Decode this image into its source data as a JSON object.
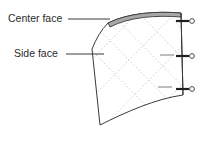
{
  "figure": {
    "background_color": "#ffffff",
    "line_color": "#3a3a3a",
    "dotted_grid_color": "#c2c2c2",
    "shaded_fill_color": "#a8a8a8",
    "labels": [
      {
        "id": "center-face",
        "text": "Center face",
        "x": 8,
        "y": 19,
        "leader_from_x": 68,
        "leader_from_y": 19,
        "leader_to_x": 110,
        "leader_to_y": 19
      },
      {
        "id": "side-face",
        "text": "Side face",
        "x": 14,
        "y": 54,
        "leader_from_x": 66,
        "leader_from_y": 54,
        "leader_to_x": 104,
        "leader_to_y": 54
      }
    ],
    "edge_markers": [
      {
        "id": "marker-top",
        "stub_x1": 176,
        "stub_x2": 189,
        "y": 21,
        "circle_cx": 192,
        "circle_cy": 21,
        "circle_r": 2.4
      },
      {
        "id": "marker-middle",
        "stub_x1": 176,
        "stub_x2": 189,
        "y": 56,
        "circle_cx": 192,
        "circle_cy": 56,
        "circle_r": 2.4
      },
      {
        "id": "marker-bottom",
        "stub_x1": 176,
        "stub_x2": 189,
        "y": 89,
        "circle_cx": 192,
        "circle_cy": 89,
        "circle_r": 2.4
      }
    ],
    "shell": {
      "name": "curved-shell-surface",
      "outline_path": "M 108,23 C 128,13 156,11 181,13 L 183,95 C 155,99 126,112 100,125 L 92,49 C 96,39 101,30 108,23 Z"
    },
    "center_face_band": {
      "name": "center-face-shaded-band",
      "path": "M 108,23 C 128,13 156,11 181,13 L 181,17 C 156,15 129,17 110,27 Z"
    },
    "right_edge": {
      "name": "right-vertical-edge",
      "x_top": 181,
      "y_top": 13,
      "x_bottom": 183,
      "y_bottom": 95
    },
    "tick_arrows": [
      {
        "id": "tick-arrow-middle",
        "x1": 160,
        "y1": 55,
        "x2": 174,
        "y2": 55
      },
      {
        "id": "tick-arrow-lower",
        "x1": 158,
        "y1": 87,
        "x2": 172,
        "y2": 87
      }
    ]
  }
}
